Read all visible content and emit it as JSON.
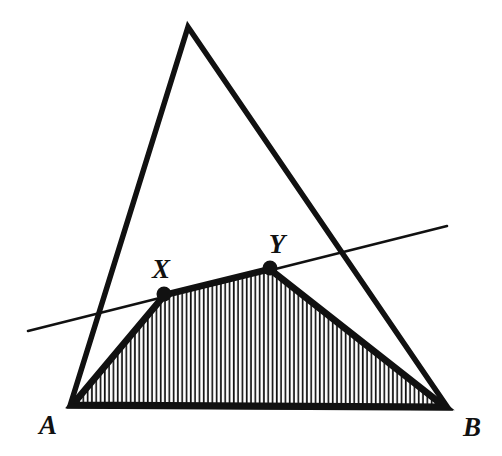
{
  "figure": {
    "canvas": {
      "width": 502,
      "height": 456,
      "background": "#ffffff"
    },
    "ink_color": "#111111",
    "points": {
      "A": {
        "label": "A",
        "x": 70,
        "y": 406,
        "label_x": 48,
        "label_y": 434
      },
      "B": {
        "label": "B",
        "x": 448,
        "y": 408,
        "label_x": 464,
        "label_y": 436
      },
      "X": {
        "label": "X",
        "x": 164,
        "y": 294,
        "label_x": 152,
        "label_y": 278
      },
      "Y": {
        "label": "Y",
        "x": 270,
        "y": 268,
        "label_x": 268,
        "label_y": 253
      },
      "apex": {
        "label": "",
        "x": 188,
        "y": 27
      }
    },
    "shapes": {
      "outer_triangle": {
        "name": "outer-triangle",
        "vertices": [
          [
            188,
            27
          ],
          [
            70,
            406
          ],
          [
            448,
            408
          ]
        ],
        "stroke_width": 5.5,
        "fill": "none"
      },
      "shaded_region": {
        "name": "shaded-quadrilateral-AXYB",
        "vertices": [
          [
            70,
            406
          ],
          [
            164,
            294
          ],
          [
            270,
            268
          ],
          [
            448,
            408
          ]
        ],
        "stroke_width": 5.0,
        "hatch": {
          "orientation": "vertical",
          "spacing": 4.3,
          "line_width": 1.7
        }
      },
      "transversal": {
        "name": "transversal-line-XY",
        "from": [
          28,
          331
        ],
        "to": [
          447,
          226
        ],
        "stroke_width": 2.6
      }
    },
    "marker_dots": {
      "radius": 7.5,
      "color": "#111111"
    },
    "label_font_size": 27
  }
}
